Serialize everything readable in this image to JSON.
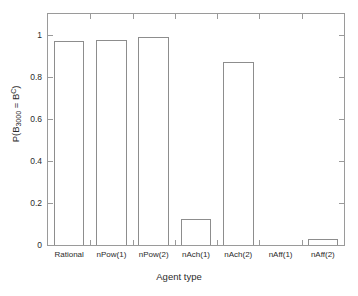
{
  "chart_data": {
    "type": "bar",
    "title": "",
    "categories": [
      "Rational",
      "nPow(1)",
      "nPow(2)",
      "nAch(1)",
      "nAch(2)",
      "nAff(1)",
      "nAff(2)"
    ],
    "values": [
      0.973,
      0.974,
      0.991,
      0.125,
      0.87,
      0.0,
      0.028
    ],
    "xlabel": "Agent type",
    "ylabel_plain": "P(B_3000 = B^C)",
    "ylabel_parts": {
      "prefix": "P(B",
      "subscript": "3000",
      "middle": " = B",
      "superscript": "C",
      "suffix": ")"
    },
    "ylim": [
      0,
      1.1
    ],
    "ytick_labels": [
      "0",
      "0.2",
      "0.4",
      "0.6",
      "0.8",
      "1"
    ],
    "ytick_values": [
      0,
      0.2,
      0.4,
      0.6,
      0.8,
      1
    ],
    "xtick_labels": [
      "Rational",
      "nPow(1)",
      "nPow(2)",
      "nAch(1)",
      "nAch(2)",
      "nAff(1)",
      "nAff(2)"
    ],
    "grid": false,
    "legend": null,
    "bar_face_color": "#ffffff",
    "bar_edge_color": "#8d8d8d",
    "axis_color": "#9a9a9a",
    "background_color": "#ffffff"
  }
}
